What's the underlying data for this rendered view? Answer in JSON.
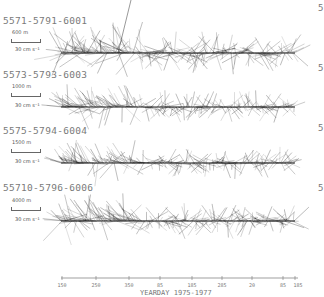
{
  "chart_data": {
    "type": "stick-vector",
    "title": "",
    "xlabel": "YEARDAY 1975-1977",
    "ylabel": "",
    "x_tick_labels": [
      "150",
      "250",
      "350",
      "85",
      "185",
      "285",
      "20",
      "85",
      "185"
    ],
    "scale_reference": "30 cm s-1",
    "series": [
      {
        "name": "5571-5791-6001",
        "depth": "600 m",
        "scale": "30 cm s⁻¹",
        "baseline_y": 53,
        "label_y": 18,
        "amplitude": 1.0
      },
      {
        "name": "5573-5793-6003",
        "depth": "1000 m",
        "scale": "30 cm s⁻¹",
        "baseline_y": 107,
        "label_y": 71,
        "amplitude": 0.75
      },
      {
        "name": "5575-5794-6004",
        "depth": "1500 m",
        "scale": "30 cm s⁻¹",
        "baseline_y": 163,
        "label_y": 126,
        "amplitude": 0.72
      },
      {
        "name": "55710-5796-6006",
        "depth": "4000 m",
        "scale": "30 cm s⁻¹",
        "baseline_y": 221,
        "label_y": 181,
        "amplitude": 0.85
      }
    ],
    "x_range_px": [
      61,
      295
    ],
    "grid": false,
    "legend": "none"
  },
  "edge_glyphs": [
    "5",
    "5",
    "5",
    "5"
  ],
  "edge_glyph_y": [
    3,
    63,
    123,
    183
  ],
  "ticks_x": [
    62,
    96,
    129,
    160,
    192,
    222,
    252,
    283,
    295
  ]
}
